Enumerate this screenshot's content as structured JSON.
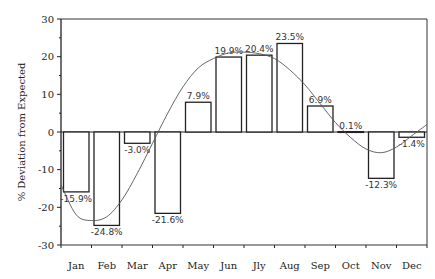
{
  "chart_data": {
    "type": "bar",
    "title": "",
    "xlabel": "",
    "ylabel": "% Deviation from Expected",
    "ylim": [
      -30,
      30
    ],
    "yticks": [
      30,
      20,
      10,
      0,
      -10,
      -20,
      -30
    ],
    "grid": false,
    "legend": null,
    "categories": [
      "Jan",
      "Feb",
      "Mar",
      "Apr",
      "May",
      "Jun",
      "Jly",
      "Aug",
      "Sep",
      "Oct",
      "Nov",
      "Dec"
    ],
    "values": [
      -15.9,
      -24.8,
      -3.0,
      -21.6,
      7.9,
      19.9,
      20.4,
      23.5,
      6.9,
      0.1,
      -12.3,
      -1.4
    ],
    "data_labels": [
      "-15.9%",
      "-24.8%",
      "-3.0%",
      "-21.6%",
      "7.9%",
      "19.9%",
      "20.4%",
      "23.5%",
      "6.9%",
      "0.1%",
      "-12.3%",
      "-1.4%"
    ],
    "overlay": {
      "type": "line",
      "description": "smooth sinusoidal fitted curve",
      "points": [
        {
          "x": 0,
          "y": -14
        },
        {
          "x": 0.5,
          "y": -22
        },
        {
          "x": 1,
          "y": -23.5
        },
        {
          "x": 1.5,
          "y": -22.5
        },
        {
          "x": 2,
          "y": -18
        },
        {
          "x": 2.5,
          "y": -11
        },
        {
          "x": 3,
          "y": -3
        },
        {
          "x": 3.5,
          "y": 5
        },
        {
          "x": 4,
          "y": 12
        },
        {
          "x": 4.5,
          "y": 17
        },
        {
          "x": 5,
          "y": 19.5
        },
        {
          "x": 5.5,
          "y": 21
        },
        {
          "x": 6,
          "y": 21.2
        },
        {
          "x": 6.5,
          "y": 20.8
        },
        {
          "x": 7,
          "y": 19.5
        },
        {
          "x": 7.5,
          "y": 16.5
        },
        {
          "x": 8,
          "y": 12.5
        },
        {
          "x": 8.5,
          "y": 7.5
        },
        {
          "x": 9,
          "y": 2.5
        },
        {
          "x": 9.5,
          "y": -1.5
        },
        {
          "x": 10,
          "y": -4.5
        },
        {
          "x": 10.5,
          "y": -5.5
        },
        {
          "x": 11,
          "y": -4
        },
        {
          "x": 11.5,
          "y": -1
        },
        {
          "x": 12,
          "y": 2
        }
      ]
    }
  }
}
